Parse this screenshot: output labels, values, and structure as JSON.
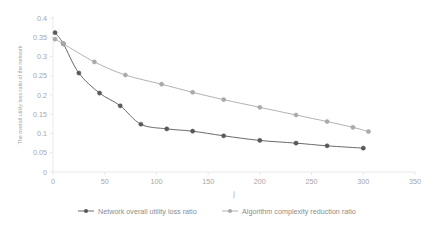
{
  "chart_data": {
    "type": "line",
    "title": "",
    "xlabel": "j",
    "ylabel": "The overall utility loss ratio of the network",
    "xlim": [
      0,
      350
    ],
    "ylim": [
      0,
      0.4
    ],
    "grid": false,
    "legend_position": "bottom",
    "xticks": [
      "0",
      "50",
      "100",
      "150",
      "200",
      "250",
      "300",
      "350"
    ],
    "xtick_values": [
      0,
      50,
      100,
      150,
      200,
      250,
      300,
      350
    ],
    "yticks": [
      "0",
      "0.05",
      "0.1",
      "0.15",
      "0.2",
      "0.25",
      "0.3",
      "0.35",
      "0.4"
    ],
    "ytick_values": [
      0,
      0.05,
      0.1,
      0.15,
      0.2,
      0.25,
      0.3,
      0.35,
      0.4
    ],
    "series": [
      {
        "name": "Network overall utility loss ratio",
        "color": "#595959",
        "marker": "circle",
        "x": [
          2,
          10,
          25,
          45,
          65,
          85,
          110,
          135,
          165,
          200,
          235,
          265,
          300
        ],
        "values": [
          0.362,
          0.333,
          0.257,
          0.205,
          0.172,
          0.124,
          0.112,
          0.106,
          0.094,
          0.082,
          0.075,
          0.068,
          0.062
        ]
      },
      {
        "name": "Algorithm complexity reduction ratio",
        "color": "#a9a9a9",
        "marker": "circle",
        "x": [
          2,
          10,
          40,
          70,
          105,
          135,
          165,
          200,
          235,
          265,
          290,
          305
        ],
        "values": [
          0.345,
          0.333,
          0.286,
          0.252,
          0.228,
          0.207,
          0.188,
          0.168,
          0.148,
          0.131,
          0.116,
          0.105
        ]
      }
    ]
  },
  "legend": {
    "items": [
      {
        "label": "Network overall utility loss ratio",
        "color": "#595959"
      },
      {
        "label": "Algorithm complexity reduction ratio",
        "color": "#a9a9a9"
      }
    ]
  }
}
